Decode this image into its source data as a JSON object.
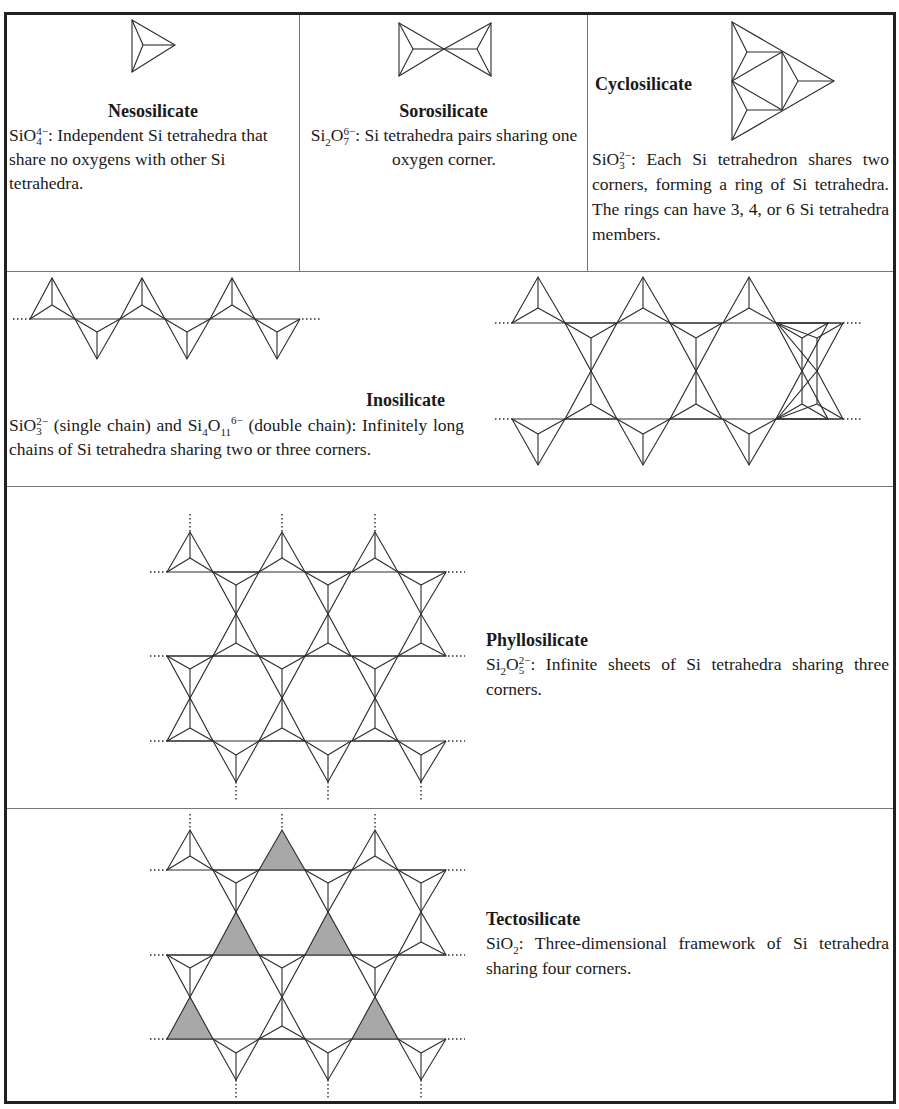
{
  "table": {
    "rows": [
      {
        "cells": [
          {
            "name": "nesosilicate",
            "title": "Nesosilicate",
            "formula": {
              "base": "SiO",
              "sub": "4",
              "sup": "4−"
            },
            "description": ": Independent Si tetrahedra that share no oxygens with other Si tetrahedra.",
            "icon": "single-tetrahedron-icon"
          },
          {
            "name": "sorosilicate",
            "title": "Sorosilicate",
            "formula": {
              "base1": "Si",
              "sub1": "2",
              "base2": "O",
              "sub2": "7",
              "sup": "6−"
            },
            "description": ": Si tetrahedra pairs sharing one oxygen corner.",
            "icon": "double-tetrahedron-icon"
          },
          {
            "name": "cyclosilicate",
            "title": "Cyclosilicate",
            "formula": {
              "base": "SiO",
              "sub": "3",
              "sup": "2−"
            },
            "description": ": Each Si tetrahedron shares two corners, forming a ring of Si tetrahedra. The rings can have 3, 4, or 6 Si tetrahedra members.",
            "icon": "ring-tetrahedra-icon"
          }
        ]
      },
      {
        "name": "inosilicate",
        "title": "Inosilicate",
        "formula_single": {
          "base": "SiO",
          "sub": "3",
          "sup": "2−",
          "label": " (single chain) and "
        },
        "formula_double": {
          "base1": "Si",
          "sub1": "4",
          "base2": "O",
          "sub2": "11",
          "sup": "6−",
          "label": " (double chain):"
        },
        "description": "Infinitely long chains of Si tetrahedra sharing two or three corners.",
        "icons": [
          "single-chain-icon",
          "double-chain-icon"
        ]
      },
      {
        "name": "phyllosilicate",
        "title": "Phyllosilicate",
        "formula": {
          "base1": "Si",
          "sub1": "2",
          "base2": "O",
          "sub2": "5",
          "sup": "2−"
        },
        "description": ": Infinite sheets of Si tetrahedra sharing three corners.",
        "icon": "sheet-tetrahedra-icon"
      },
      {
        "name": "tectosilicate",
        "title": "Tectosilicate",
        "formula": {
          "base": "SiO",
          "sub": "2"
        },
        "description": ": Three-dimensional framework of Si tetrahedra sharing four corners.",
        "icon": "framework-tetrahedra-icon",
        "shade_color": "#a8a8a8"
      }
    ]
  }
}
